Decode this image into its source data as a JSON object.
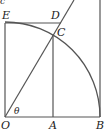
{
  "diagram": {
    "type": "geometry",
    "colors": {
      "line": "#555555",
      "arc": "#555555",
      "text": "#222222"
    },
    "points": {
      "O": {
        "label": "O",
        "x": 5,
        "y": 117
      },
      "A": {
        "label": "A",
        "x": 53,
        "y": 117
      },
      "B": {
        "label": "B",
        "x": 100,
        "y": 117
      },
      "C": {
        "label": "C",
        "x": 53,
        "y": 35
      },
      "D": {
        "label": "D",
        "x": 60,
        "y": 23
      },
      "E": {
        "label": "E",
        "x": 5,
        "y": 23
      }
    },
    "angle_label": "θ",
    "partial_top_text": "c"
  }
}
